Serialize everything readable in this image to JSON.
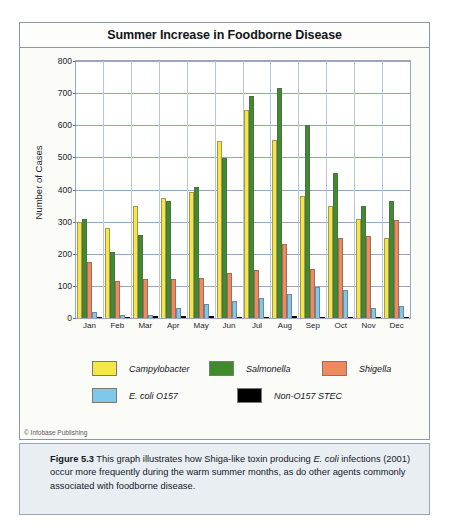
{
  "figure": {
    "title": "Summer Increase in Foodborne Disease",
    "copyright": "© Infobase Publishing",
    "caption_label": "Figure 5.3",
    "caption_text_1": " This graph illustrates how Shiga-like toxin producing ",
    "caption_em_1": "E. coli",
    "caption_text_2": " infections (2001) occur more frequently during the warm summer months, as do other agents commonly associated with foodborne disease."
  },
  "legend": {
    "rows": [
      [
        {
          "label": "Campylobacter",
          "color": "#F7E648"
        },
        {
          "label": "Salmonella",
          "color": "#3E8C2C"
        },
        {
          "label": "Shigella",
          "color": "#F08A5D"
        }
      ],
      [
        {
          "label": "E. coli O157",
          "color": "#7EC8EC"
        },
        {
          "label": "Non-O157 STEC",
          "color": "#000000"
        }
      ]
    ]
  },
  "chart_data": {
    "type": "bar",
    "title": "Summer Increase in Foodborne Disease",
    "xlabel": "",
    "ylabel": "Number of Cases",
    "ylim": [
      0,
      800
    ],
    "yticks": [
      0,
      100,
      200,
      300,
      400,
      500,
      600,
      700,
      800
    ],
    "grid": true,
    "legend_position": "below",
    "categories": [
      "Jan",
      "Feb",
      "Mar",
      "Apr",
      "May",
      "Jun",
      "Jul",
      "Aug",
      "Sep",
      "Oct",
      "Nov",
      "Dec"
    ],
    "series": [
      {
        "name": "Campylobacter",
        "color": "#F7E648",
        "values": [
          300,
          280,
          350,
          375,
          392,
          550,
          648,
          555,
          380,
          350,
          307,
          250
        ]
      },
      {
        "name": "Salmonella",
        "color": "#3E8C2C",
        "values": [
          307,
          207,
          258,
          365,
          408,
          498,
          692,
          715,
          600,
          450,
          350,
          365
        ]
      },
      {
        "name": "Shigella",
        "color": "#F08A5D",
        "values": [
          175,
          115,
          122,
          123,
          125,
          140,
          150,
          230,
          152,
          250,
          256,
          305
        ]
      },
      {
        "name": "E. coli O157",
        "color": "#7EC8EC",
        "values": [
          20,
          10,
          8,
          30,
          45,
          53,
          63,
          75,
          98,
          87,
          32,
          38
        ]
      },
      {
        "name": "Non-O157 STEC",
        "color": "#000000",
        "values": [
          3,
          2,
          5,
          5,
          5,
          3,
          4,
          5,
          4,
          3,
          2,
          2
        ]
      }
    ]
  }
}
